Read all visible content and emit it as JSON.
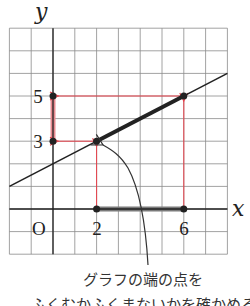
{
  "figure": {
    "axis_labels": {
      "x": "x",
      "y": "y"
    },
    "origin_label": "O",
    "tick_labels": {
      "x": [
        {
          "value": 2,
          "label": "2"
        },
        {
          "value": 6,
          "label": "6"
        }
      ],
      "y": [
        {
          "value": 3,
          "label": "3"
        },
        {
          "value": 5,
          "label": "5"
        }
      ]
    },
    "grid": {
      "x_range": [
        -2,
        8
      ],
      "y_range": [
        -2,
        8
      ],
      "step": 1
    },
    "line": {
      "slope": 0.5,
      "intercept": 2,
      "equation": "y = x/2 + 2"
    },
    "domain_segment": {
      "from": 2,
      "to": 6
    },
    "range_segment": {
      "from": 3,
      "to": 5
    },
    "endpoints": [
      {
        "x": 2,
        "y": 3
      },
      {
        "x": 6,
        "y": 5
      }
    ],
    "colors": {
      "guide_arrows": "#e8404a",
      "range_highlight": "#e88a90",
      "domain_highlight": "#7a7a7a",
      "line": "#222222",
      "grid": "#8a8a8a"
    }
  },
  "caption": {
    "line1": "グラフの端の点を",
    "line2": "ふくむかふくまないかを確かめる"
  },
  "chart_data": {
    "type": "line",
    "title": "",
    "xlabel": "x",
    "ylabel": "y",
    "xlim": [
      -2,
      8
    ],
    "ylim": [
      -2,
      8
    ],
    "grid": true,
    "series": [
      {
        "name": "y = x/2 + 2",
        "x": [
          -2,
          8
        ],
        "y": [
          1,
          6
        ]
      },
      {
        "name": "domain 2 ≤ x ≤ 6",
        "x": [
          2,
          6
        ],
        "y": [
          3,
          5
        ]
      }
    ],
    "annotations": [
      {
        "text": "range 3 ≤ y ≤ 5 on y-axis"
      },
      {
        "text": "グラフの端の点を"
      }
    ]
  }
}
